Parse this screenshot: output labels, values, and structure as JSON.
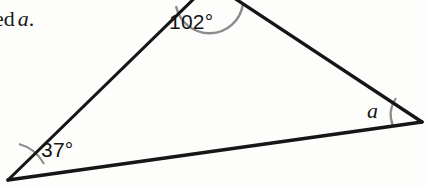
{
  "figure": {
    "kind": "geometry-triangle-diagram",
    "background_color": "#fdfdfc",
    "stroke_color": "#161616",
    "arc_color": "#8c8c8c",
    "prompt_fragment": {
      "text_before": "ed",
      "variable": "a",
      "text_after": "."
    },
    "angles": {
      "apex": {
        "label": "102°",
        "value": 102,
        "unit": "degrees",
        "vertex_position": "top",
        "arc": "present-cropped"
      },
      "left": {
        "label": "37°",
        "value": 37,
        "unit": "degrees",
        "vertex_position": "bottom-left",
        "arc": "present"
      },
      "right": {
        "label": "a",
        "value": null,
        "unit": "unknown",
        "vertex_position": "bottom-right",
        "arc": "present"
      }
    },
    "geometry": {
      "apex_vertex": [
        210,
        -16
      ],
      "left_vertex": [
        8,
        180
      ],
      "right_vertex": [
        422,
        122
      ],
      "edges": [
        "left-vertex-to-apex",
        "apex-to-right-vertex",
        "left-vertex-to-right-vertex"
      ]
    }
  }
}
